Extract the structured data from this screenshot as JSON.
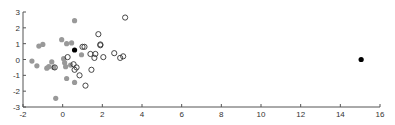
{
  "chart_data": {
    "type": "scatter",
    "title": "",
    "xlabel": "",
    "ylabel": "",
    "xlim": [
      -2,
      16
    ],
    "ylim": [
      -3,
      3
    ],
    "grid": false,
    "legend": null,
    "x_ticks": [
      -2,
      0,
      2,
      4,
      6,
      8,
      10,
      12,
      14,
      16
    ],
    "y_ticks": [
      -3,
      -2,
      -1,
      0,
      1,
      2,
      3
    ],
    "series": [
      {
        "name": "gray-filled",
        "marker": "filled-circle",
        "color": "#999999",
        "points": [
          [
            -1.55,
            -0.1
          ],
          [
            -1.2,
            0.85
          ],
          [
            -1.0,
            0.95
          ],
          [
            -1.3,
            -0.4
          ],
          [
            -0.8,
            -0.55
          ],
          [
            -0.7,
            -0.45
          ],
          [
            -0.55,
            -0.15
          ],
          [
            -0.45,
            -0.5
          ],
          [
            -0.05,
            1.25
          ],
          [
            0.05,
            0.05
          ],
          [
            0.1,
            -0.2
          ],
          [
            0.15,
            -0.45
          ],
          [
            0.2,
            1.0
          ],
          [
            0.45,
            1.05
          ],
          [
            0.6,
            2.45
          ],
          [
            0.2,
            -1.2
          ],
          [
            0.6,
            -1.45
          ],
          [
            -0.35,
            -2.45
          ],
          [
            0.95,
            0.3
          ],
          [
            0.4,
            -0.35
          ]
        ]
      },
      {
        "name": "open-circles",
        "marker": "open-circle",
        "color": "#333333",
        "points": [
          [
            -0.4,
            -0.5
          ],
          [
            0.25,
            0.15
          ],
          [
            0.55,
            -0.3
          ],
          [
            0.6,
            -0.65
          ],
          [
            0.7,
            -0.5
          ],
          [
            0.85,
            -1.0
          ],
          [
            1.0,
            0.8
          ],
          [
            1.1,
            0.8
          ],
          [
            1.15,
            -1.65
          ],
          [
            1.4,
            0.35
          ],
          [
            1.45,
            -0.65
          ],
          [
            1.6,
            0.1
          ],
          [
            1.65,
            0.35
          ],
          [
            1.8,
            1.6
          ],
          [
            1.9,
            0.9
          ],
          [
            1.9,
            0.95
          ],
          [
            2.05,
            0.15
          ],
          [
            2.6,
            0.4
          ],
          [
            2.9,
            0.1
          ],
          [
            3.05,
            0.2
          ],
          [
            3.15,
            2.65
          ]
        ]
      },
      {
        "name": "black-filled",
        "marker": "filled-circle",
        "color": "#000000",
        "points": [
          [
            0.6,
            0.6
          ],
          [
            15.05,
            0.0
          ]
        ]
      }
    ]
  },
  "layout": {
    "plot_left": 23,
    "plot_right": 380,
    "plot_top": 12,
    "plot_bottom": 107
  }
}
